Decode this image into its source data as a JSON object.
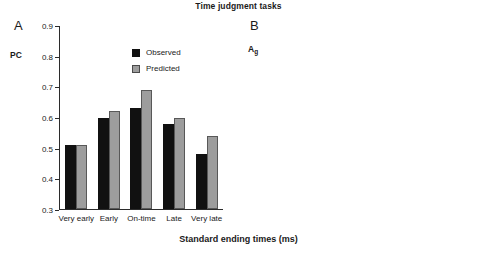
{
  "figure": {
    "title": "Time judgment tasks",
    "shared_xlabel": "Standard ending times (ms)"
  },
  "panelA": {
    "letter": "A",
    "ylabel": "PC",
    "legend": [
      {
        "label": "Observed",
        "color": "#111111"
      },
      {
        "label": "Predicted",
        "color": "#9d9d9d"
      }
    ],
    "yticks": [
      "0.9",
      "0.8",
      "0.7",
      "0.6",
      "0.5",
      "0.4",
      "0.3"
    ],
    "xticks": [
      "Very early",
      "Early",
      "On-time",
      "Late",
      "Very late"
    ]
  },
  "panelB": {
    "letter": "B",
    "ylabel": "A",
    "ylabel_sub": "g",
    "legend": [
      {
        "label": "300",
        "color": "#111111"
      },
      {
        "label": "500",
        "color": "#dcdcdc"
      },
      {
        "label": "600",
        "color": "#a6a6a6"
      }
    ],
    "yticks": [
      "1",
      "0.9",
      "0.8",
      "0.7",
      "0.6",
      "0.5",
      "0.4"
    ],
    "xticks": [
      "524",
      "600",
      "676"
    ]
  },
  "chart_data": [
    {
      "type": "bar",
      "panel": "A",
      "title": "Time judgment tasks",
      "xlabel": "Standard ending times (ms)",
      "ylabel": "PC",
      "ylim": [
        0.3,
        0.9
      ],
      "ytick_values": [
        0.3,
        0.4,
        0.5,
        0.6,
        0.7,
        0.8,
        0.9
      ],
      "grid": false,
      "legend_position": "top-right-inside",
      "categories": [
        "Very early",
        "Early",
        "On-time",
        "Late",
        "Very late"
      ],
      "series": [
        {
          "name": "Observed",
          "color": "#111111",
          "values": [
            0.51,
            0.6,
            0.63,
            0.58,
            0.48
          ]
        },
        {
          "name": "Predicted",
          "color": "#9d9d9d",
          "values": [
            0.51,
            0.62,
            0.69,
            0.6,
            0.54
          ]
        }
      ]
    },
    {
      "type": "bar",
      "panel": "B",
      "title": "Time judgment tasks",
      "xlabel": "Standard ending times (ms)",
      "ylabel": "Ag",
      "ylim": [
        0.4,
        1.0
      ],
      "ytick_values": [
        0.4,
        0.5,
        0.6,
        0.7,
        0.8,
        0.9,
        1.0
      ],
      "grid": false,
      "legend_position": "top-right-inside",
      "categories": [
        "524",
        "600",
        "676"
      ],
      "series": [
        {
          "name": "300",
          "color": "#111111",
          "values": [
            0.58,
            0.77,
            0.56
          ]
        },
        {
          "name": "500",
          "color": "#dcdcdc",
          "values": [
            0.72,
            0.71,
            0.55
          ]
        },
        {
          "name": "600",
          "color": "#a6a6a6",
          "values": [
            0.66,
            0.86,
            0.68
          ]
        }
      ]
    }
  ]
}
